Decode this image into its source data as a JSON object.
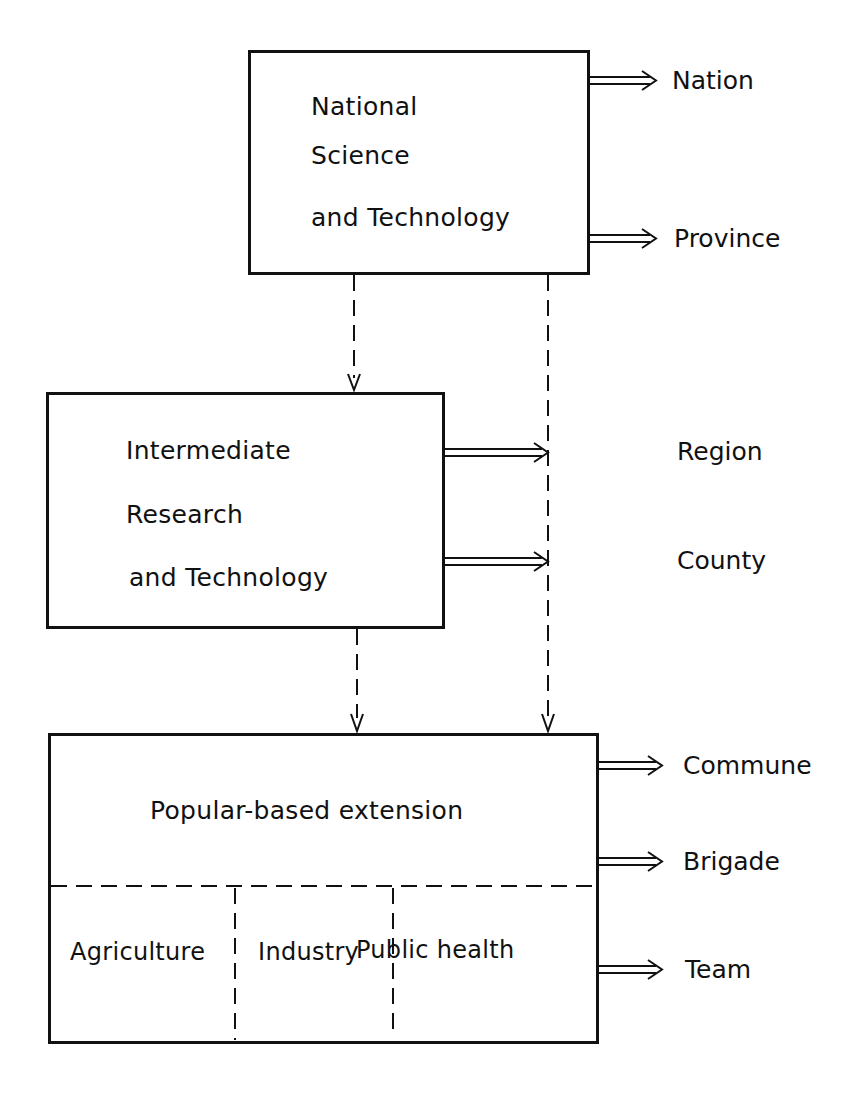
{
  "diagram": {
    "boxes": {
      "national": {
        "lines": [
          "National",
          "Science",
          "and Technology"
        ]
      },
      "intermediate": {
        "lines": [
          "Intermediate",
          "Research",
          "and Technology"
        ]
      },
      "popular": {
        "title": "Popular-based extension",
        "sectors": [
          "Agriculture",
          "Industry",
          "Public health"
        ]
      }
    },
    "levels": [
      "Nation",
      "Province",
      "Region",
      "County",
      "Commune",
      "Brigade",
      "Team"
    ],
    "colors": {
      "line": "#111111",
      "background": "#ffffff"
    }
  }
}
